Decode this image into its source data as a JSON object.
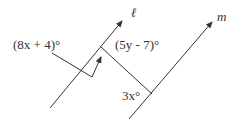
{
  "diagram": {
    "lines": {
      "l": {
        "label": "ℓ"
      },
      "m": {
        "label": "m"
      }
    },
    "angles": {
      "left": "(8x + 4)°",
      "top": "(5y - 7)°",
      "bottom": "3x°"
    },
    "colors": {
      "stroke": "#333333",
      "text": "#333333"
    }
  }
}
